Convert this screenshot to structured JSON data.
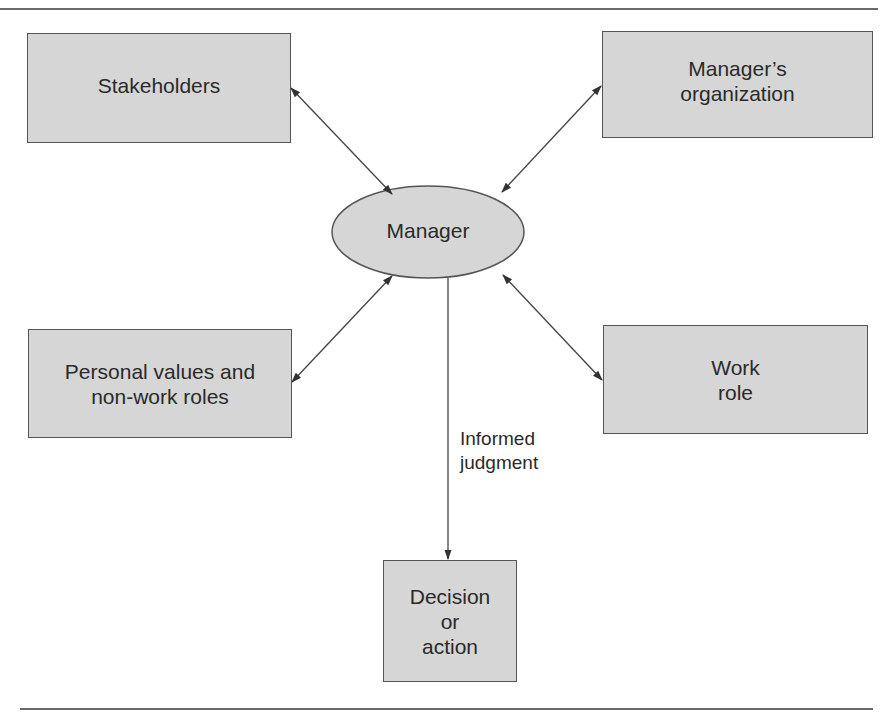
{
  "diagram": {
    "center": {
      "id": "manager",
      "label": "Manager",
      "shape": "ellipse"
    },
    "nodes": [
      {
        "id": "stakeholders",
        "label": "Stakeholders",
        "shape": "rect"
      },
      {
        "id": "managers-organization",
        "label": "Manager’s\norganization",
        "shape": "rect"
      },
      {
        "id": "personal-values",
        "label": "Personal values and\nnon-work roles",
        "shape": "rect"
      },
      {
        "id": "work-role",
        "label": "Work\nrole",
        "shape": "rect"
      },
      {
        "id": "decision",
        "label": "Decision\nor\naction",
        "shape": "rect"
      }
    ],
    "edges": [
      {
        "from": "stakeholders",
        "to": "manager",
        "direction": "both"
      },
      {
        "from": "managers-organization",
        "to": "manager",
        "direction": "both"
      },
      {
        "from": "personal-values",
        "to": "manager",
        "direction": "both"
      },
      {
        "from": "work-role",
        "to": "manager",
        "direction": "both"
      },
      {
        "from": "manager",
        "to": "decision",
        "direction": "forward",
        "label": "Informed\njudgment"
      }
    ],
    "colors": {
      "box_fill": "#d6d6d6",
      "box_border": "#555555",
      "line": "#444444",
      "rule": "#6a6a6a"
    }
  }
}
